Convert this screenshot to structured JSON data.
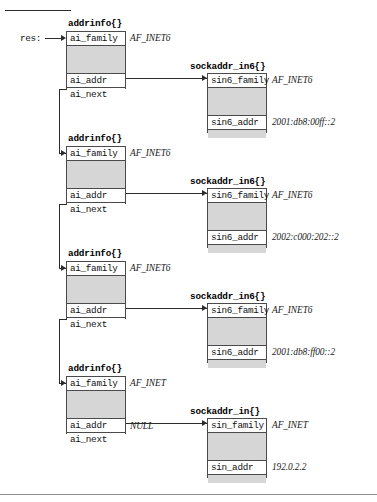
{
  "page": {
    "pointer_label": "res:",
    "null_label": "NULL"
  },
  "structs": {
    "addrinfo_title": "addrinfo{}",
    "sockaddr_in6_title": "sockaddr_in6{}",
    "sockaddr_in_title": "sockaddr_in{}",
    "addrinfo_fields": {
      "family": "ai_family",
      "addr": "ai_addr",
      "next": "ai_next"
    },
    "sockaddr_in6_fields": {
      "family": "sin6_family",
      "addr": "sin6_addr"
    },
    "sockaddr_in_fields": {
      "family": "sin_family",
      "addr": "sin_addr"
    }
  },
  "chain": [
    {
      "index": 0,
      "addrinfo": {
        "title": "addrinfo{}",
        "ai_family_label": "ai_family",
        "ai_family_value": "AF_INET6",
        "ai_addr_label": "ai_addr",
        "ai_next_label": "ai_next",
        "ai_next_value": ""
      },
      "sockaddr": {
        "title": "sockaddr_in6{}",
        "family_label": "sin6_family",
        "family_value": "AF_INET6",
        "addr_label": "sin6_addr",
        "addr_value": "2001:db8:00ff::2"
      }
    },
    {
      "index": 1,
      "addrinfo": {
        "title": "addrinfo{}",
        "ai_family_label": "ai_family",
        "ai_family_value": "AF_INET6",
        "ai_addr_label": "ai_addr",
        "ai_next_label": "ai_next",
        "ai_next_value": ""
      },
      "sockaddr": {
        "title": "sockaddr_in6{}",
        "family_label": "sin6_family",
        "family_value": "AF_INET6",
        "addr_label": "sin6_addr",
        "addr_value": "2002:c000:202::2"
      }
    },
    {
      "index": 2,
      "addrinfo": {
        "title": "addrinfo{}",
        "ai_family_label": "ai_family",
        "ai_family_value": "AF_INET6",
        "ai_addr_label": "ai_addr",
        "ai_next_label": "ai_next",
        "ai_next_value": ""
      },
      "sockaddr": {
        "title": "sockaddr_in6{}",
        "family_label": "sin6_family",
        "family_value": "AF_INET6",
        "addr_label": "sin6_addr",
        "addr_value": "2001:db8:ff00::2"
      }
    },
    {
      "index": 3,
      "addrinfo": {
        "title": "addrinfo{}",
        "ai_family_label": "ai_family",
        "ai_family_value": "AF_INET",
        "ai_addr_label": "ai_addr",
        "ai_next_label": "ai_next",
        "ai_next_value": "NULL"
      },
      "sockaddr": {
        "title": "sockaddr_in{}",
        "family_label": "sin_family",
        "family_value": "AF_INET",
        "addr_label": "sin_addr",
        "addr_value": "192.0.2.2"
      }
    }
  ],
  "colors": {
    "line": "#2b2b2b",
    "border": "#4a4a4a",
    "fill_gray": "#d6d6d6",
    "background": "#ffffff"
  }
}
